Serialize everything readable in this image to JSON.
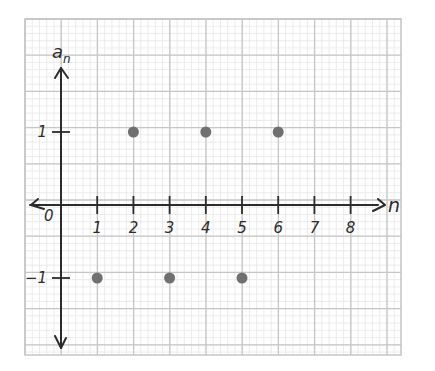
{
  "chart_data": {
    "type": "scatter",
    "title": "",
    "xlabel": "n",
    "ylabel": "a_n",
    "ylabel_display": {
      "base": "a",
      "subscript": "n"
    },
    "origin_label": "0",
    "x_ticks": [
      1,
      2,
      3,
      4,
      5,
      6,
      7,
      8
    ],
    "x_tick_labels": [
      "1",
      "2",
      "3",
      "4",
      "5",
      "6",
      "7",
      "8"
    ],
    "y_ticks": [
      1,
      -1
    ],
    "y_tick_labels": [
      "1",
      "-1"
    ],
    "xlim": [
      -1,
      9.4
    ],
    "ylim": [
      -4,
      5.1
    ],
    "grid": true,
    "legend": null,
    "series": [
      {
        "name": "a_n",
        "points": [
          {
            "x": 1,
            "y": -1
          },
          {
            "x": 2,
            "y": 1
          },
          {
            "x": 3,
            "y": -1
          },
          {
            "x": 4,
            "y": 1
          },
          {
            "x": 5,
            "y": -1
          },
          {
            "x": 6,
            "y": 1
          }
        ]
      }
    ]
  },
  "style": {
    "axis_color": "#2b2b2b",
    "point_color": "#707070",
    "major_grid_color": "#c6c6c6",
    "minor_grid_color": "#e6e6e6"
  }
}
